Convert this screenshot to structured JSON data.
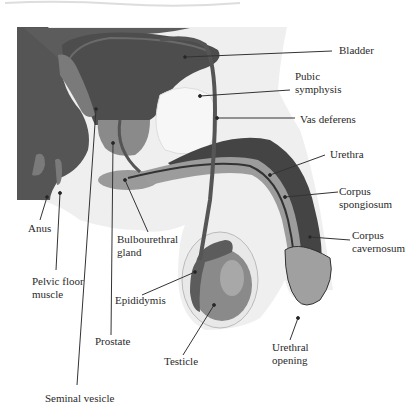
{
  "figure": {
    "header_fragment": "...the genital organs of the male...",
    "colors": {
      "dark_tissue": "#4a4a4a",
      "medium_tissue": "#777777",
      "light_tissue": "#a9a9a9",
      "pale_tissue": "#dcdcdc",
      "background": "#ffffff",
      "leader_line": "#333333"
    },
    "labels": {
      "bladder": "Bladder",
      "pubic_symphysis": "Pubic\nsymphysis",
      "vas_deferens": "Vas deferens",
      "urethra": "Urethra",
      "corpus_spongiosum": "Corpus\nspongiosum",
      "corpus_cavernosum": "Corpus\ncavernosum",
      "anus": "Anus",
      "bulbourethral_gland": "Bulbourethral\ngland",
      "pelvic_floor_muscle": "Pelvic floor\nmuscle",
      "epididymis": "Epididymis",
      "prostate": "Prostate",
      "testicle": "Testicle",
      "urethral_opening": "Urethral\nopening",
      "seminal_vesicle": "Seminal vesicle"
    }
  }
}
